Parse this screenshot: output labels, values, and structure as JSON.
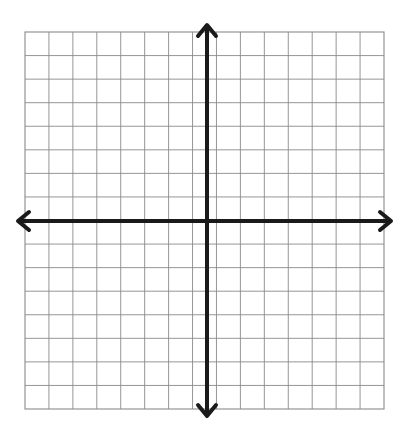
{
  "document": {
    "title": "Blank Coordinate Grid",
    "background_color": "#ffffff",
    "width": 404,
    "height": 424
  },
  "chart_data": {
    "type": "scatter",
    "title": "",
    "subtitle": "",
    "xlabel": "",
    "ylabel": "",
    "series": [],
    "x": [],
    "values": [],
    "annotations": [],
    "legend": {
      "entries": [],
      "position": "none"
    },
    "grid": {
      "visible": true,
      "columns": 15,
      "rows": 16,
      "cell_size_px": 23.9,
      "line_color": "#8a8a8a",
      "line_width_px": 0.9,
      "border_color": "#8a8a8a",
      "origin_column_index": 8,
      "origin_row_index": 8
    },
    "axes": {
      "color": "#1a1a1a",
      "line_width_px": 4,
      "arrowheads": [
        "left",
        "right",
        "up",
        "down"
      ],
      "arrow_style": "open-v",
      "x_axis_label": "",
      "y_axis_label": "",
      "tick_labels_x": [],
      "tick_labels_y": [],
      "xlim": [
        -8,
        7
      ],
      "ylim": [
        -8,
        8
      ],
      "origin_px": {
        "x": 207,
        "y": 221
      }
    },
    "plot_area_px": {
      "left": 25,
      "top": 32,
      "right": 384,
      "bottom": 409
    }
  },
  "labels": {
    "plot_region_name": "coordinate-plane",
    "x_axis_name": "horizontal-axis",
    "y_axis_name": "vertical-axis"
  }
}
